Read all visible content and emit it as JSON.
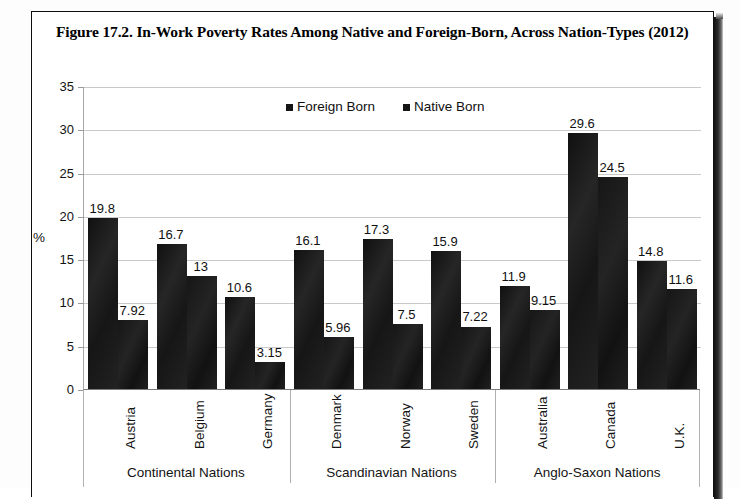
{
  "figure": {
    "caption": "Figure 17.2. In-Work Poverty Rates Among Native and Foreign-Born, Across Nation-Types (2012)"
  },
  "chart_data": {
    "type": "bar",
    "title": "Figure 17.2. In-Work Poverty Rates Among Native and Foreign-Born, Across Nation-Types (2012)",
    "xlabel": "",
    "ylabel": "%",
    "ylim": [
      0,
      35
    ],
    "yticks": [
      0,
      5,
      10,
      15,
      20,
      25,
      30,
      35
    ],
    "grid": true,
    "legend_position": "top-center",
    "categories": [
      "Austria",
      "Belgium",
      "Germany",
      "Denmark",
      "Norway",
      "Sweden",
      "Australia",
      "Canada",
      "U.K."
    ],
    "groups": [
      {
        "label": "Continental Nations",
        "categories": [
          "Austria",
          "Belgium",
          "Germany"
        ]
      },
      {
        "label": "Scandinavian Nations",
        "categories": [
          "Denmark",
          "Norway",
          "Sweden"
        ]
      },
      {
        "label": "Anglo-Saxon Nations",
        "categories": [
          "Australia",
          "Canada",
          "U.K."
        ]
      }
    ],
    "series": [
      {
        "name": "Foreign Born",
        "color": "#1b1b1b",
        "values": [
          19.8,
          16.7,
          10.6,
          16.1,
          17.3,
          15.9,
          11.9,
          29.6,
          14.8
        ],
        "labels": [
          "19.8",
          "16.7",
          "10.6",
          "16.1",
          "17.3",
          "15.9",
          "11.9",
          "29.6",
          "14.8"
        ]
      },
      {
        "name": "Native Born",
        "color": "#1b1b1b",
        "values": [
          7.92,
          13,
          3.15,
          5.96,
          7.5,
          7.22,
          9.15,
          24.5,
          11.6
        ],
        "labels": [
          "7.92",
          "13",
          "3.15",
          "5.96",
          "7.5",
          "7.22",
          "9.15",
          "24.5",
          "11.6"
        ]
      }
    ]
  },
  "axis": {
    "y_title": "%",
    "tick_labels": [
      "35",
      "30",
      "25",
      "20",
      "15",
      "10",
      "5",
      "0"
    ]
  },
  "legend": {
    "items": [
      {
        "label": "Foreign Born",
        "swatch": "legend-swatch-icon"
      },
      {
        "label": "Native Born",
        "swatch": "legend-swatch-icon"
      }
    ]
  }
}
